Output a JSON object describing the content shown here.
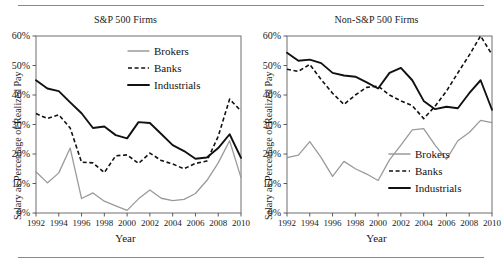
{
  "figure": {
    "axis_label_x": "Year",
    "axis_label_y": "Salary as Percentage of Realized Pay"
  },
  "legend": {
    "brokers": "Brokers",
    "banks": "Banks",
    "industrials": "Industrials"
  },
  "colors": {
    "brokers": "#9a9a9a",
    "banks": "#111111",
    "industrials": "#111111",
    "frame": "#6f6f6f",
    "text": "#1a1a1a",
    "rule": "#888888"
  },
  "chart_data": [
    {
      "type": "line",
      "title": "S&P 500 Firms",
      "xlabel": "Year",
      "ylabel": "Salary as Percentage of Realized Pay",
      "xlim": [
        1992,
        2010
      ],
      "ylim": [
        0,
        60
      ],
      "grid": false,
      "legend_position": "top-right",
      "xticks": [
        1992,
        1994,
        1996,
        1998,
        2000,
        2002,
        2004,
        2006,
        2008,
        2010
      ],
      "xticklabels": [
        "1992",
        "1994",
        "1996",
        "1998",
        "2000",
        "2002",
        "2004",
        "2006",
        "2008",
        "2010"
      ],
      "yticks": [
        0,
        10,
        20,
        30,
        40,
        50,
        60
      ],
      "yticklabels": [
        "0%",
        "10%",
        "20%",
        "30%",
        "40%",
        "50%",
        "60%"
      ],
      "x": [
        1992,
        1993,
        1994,
        1995,
        1996,
        1997,
        1998,
        1999,
        2000,
        2001,
        2002,
        2003,
        2004,
        2005,
        2006,
        2007,
        2008,
        2009,
        2010
      ],
      "series": [
        {
          "name": "Brokers",
          "values": [
            14.0,
            10.2,
            13.6,
            22.0,
            4.9,
            6.8,
            4.0,
            2.4,
            0.9,
            4.8,
            7.8,
            5.0,
            4.2,
            4.6,
            6.6,
            11.0,
            17.0,
            24.5,
            12.0
          ]
        },
        {
          "name": "Banks",
          "values": [
            33.7,
            32.0,
            33.3,
            28.8,
            17.2,
            17.0,
            13.7,
            19.4,
            19.7,
            16.8,
            20.3,
            17.8,
            16.6,
            15.0,
            16.8,
            17.6,
            26.0,
            38.6,
            34.6
          ]
        },
        {
          "name": "Industrials",
          "values": [
            45.0,
            42.2,
            41.3,
            37.5,
            33.8,
            28.8,
            29.3,
            26.4,
            25.3,
            30.8,
            30.5,
            26.8,
            23.0,
            21.0,
            18.4,
            18.8,
            22.0,
            26.7,
            18.7
          ]
        }
      ]
    },
    {
      "type": "line",
      "title": "Non-S&P 500 Firms",
      "xlabel": "Year",
      "ylabel": "Salary as Percentage of Realized Pay",
      "xlim": [
        1992,
        2010
      ],
      "ylim": [
        0,
        60
      ],
      "grid": false,
      "legend_position": "bottom-right",
      "xticks": [
        1992,
        1994,
        1996,
        1998,
        2000,
        2002,
        2004,
        2006,
        2008,
        2010
      ],
      "xticklabels": [
        "1992",
        "1994",
        "1996",
        "1998",
        "2000",
        "2002",
        "2004",
        "2006",
        "2008",
        "2010"
      ],
      "yticks": [
        0,
        10,
        20,
        30,
        40,
        50,
        60
      ],
      "yticklabels": [
        "0%",
        "10%",
        "20%",
        "30%",
        "40%",
        "50%",
        "60%"
      ],
      "x": [
        1992,
        1993,
        1994,
        1995,
        1996,
        1997,
        1998,
        1999,
        2000,
        2001,
        2002,
        2003,
        2004,
        2005,
        2006,
        2007,
        2008,
        2009,
        2010
      ],
      "series": [
        {
          "name": "Brokers",
          "values": [
            18.8,
            19.6,
            24.2,
            18.8,
            12.4,
            17.5,
            15.0,
            13.2,
            11.0,
            18.0,
            23.0,
            28.2,
            28.6,
            23.0,
            18.2,
            24.5,
            27.3,
            31.4,
            30.6
          ]
        },
        {
          "name": "Banks",
          "values": [
            48.7,
            48.0,
            50.4,
            45.2,
            40.6,
            36.8,
            40.0,
            42.6,
            43.0,
            40.0,
            38.0,
            36.4,
            32.0,
            36.2,
            41.3,
            47.5,
            53.5,
            60.0,
            53.7
          ]
        },
        {
          "name": "Industrials",
          "values": [
            54.3,
            51.6,
            52.0,
            50.8,
            47.5,
            46.6,
            46.2,
            44.3,
            42.2,
            47.5,
            49.2,
            45.0,
            38.0,
            35.2,
            36.0,
            35.5,
            40.6,
            45.0,
            35.0
          ]
        }
      ]
    }
  ]
}
